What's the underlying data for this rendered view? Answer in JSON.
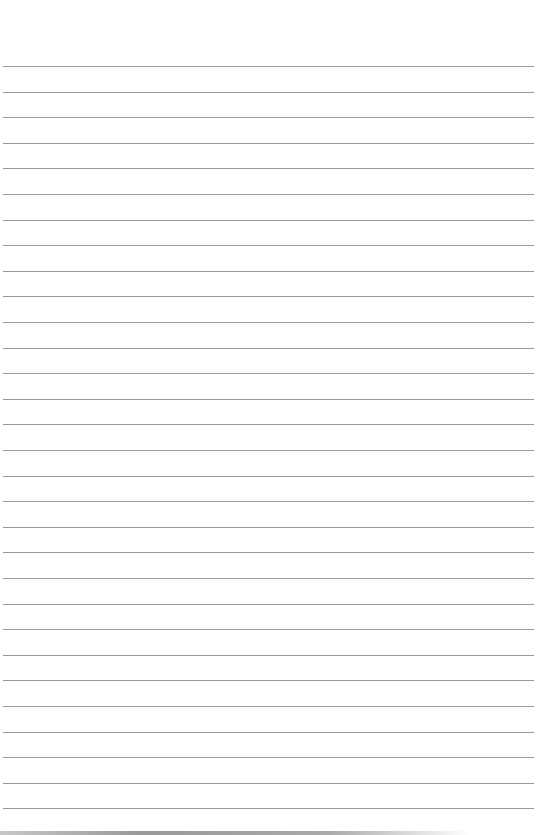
{
  "page": {
    "type": "lined-paper",
    "line_count": 30,
    "first_line_y": 66,
    "line_spacing": 25.6,
    "line_color": "#9a9a9a",
    "background": "#ffffff"
  }
}
